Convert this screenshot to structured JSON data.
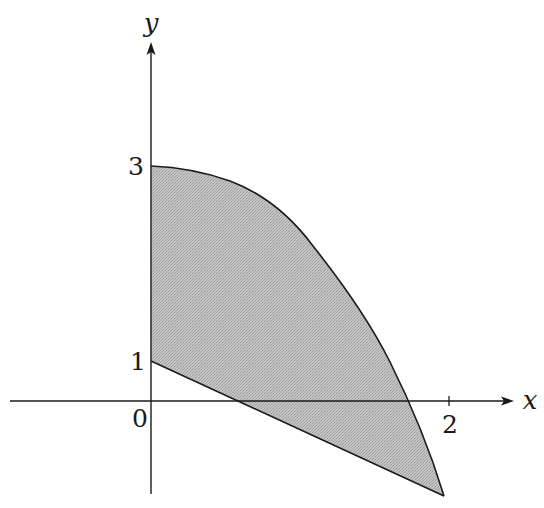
{
  "figure": {
    "type": "shaded-region-diagram",
    "colors": {
      "background": "#ffffff",
      "axis": "#1a1a1a",
      "curve": "#1a1a1a",
      "fill": "#b8b8b8"
    },
    "axes": {
      "x_label": "x",
      "y_label": "y",
      "origin_label": "0"
    },
    "ticks": {
      "x": [
        {
          "value": 2,
          "label": "2"
        }
      ],
      "y": [
        {
          "value": 1,
          "label": "1"
        },
        {
          "value": 3,
          "label": "3"
        }
      ]
    },
    "region": {
      "description": "Shaded region bounded by the y-axis, a concave-down curve from (0,3) descending past (2,0)-ish, and a straight line from (0,1) descending below the x-axis to meet the curve.",
      "upper_boundary": "curve starting at (0,3)",
      "lower_boundary": "line starting at (0,1)",
      "left_boundary": "y-axis"
    }
  }
}
